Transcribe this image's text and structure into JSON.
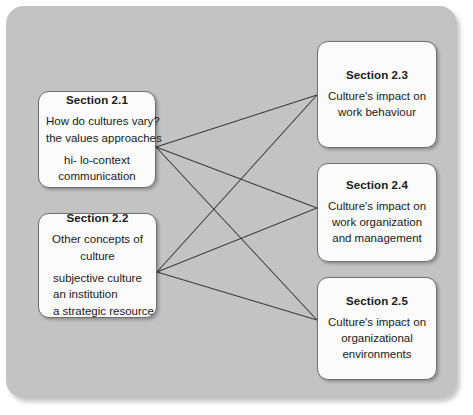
{
  "diagram": {
    "type": "bipartite-link-map",
    "colors": {
      "panel_background": "#c3c3c3",
      "node_fill": "#fbfbfb",
      "node_border": "#6e6e6e",
      "link_stroke": "#3c3c3c",
      "text": "#1a1a1a",
      "page_background": "#ffffff"
    },
    "nodes": [
      {
        "id": "s21",
        "title": "Section 2.1",
        "group_a": [
          "How do cultures vary?",
          "the values approaches"
        ],
        "group_b": [
          "hi- lo-context",
          "communication"
        ],
        "align": "center",
        "side": "left"
      },
      {
        "id": "s22",
        "title": "Section 2.2",
        "group_a": [
          "Other concepts of",
          "culture"
        ],
        "group_b": [
          "subjective culture",
          "an institution",
          "a strategic resource"
        ],
        "align": "left",
        "side": "left"
      },
      {
        "id": "s23",
        "title": "Section 2.3",
        "group_a": [
          "Culture's impact on",
          "work behaviour"
        ],
        "group_b": [],
        "align": "center",
        "side": "right"
      },
      {
        "id": "s24",
        "title": "Section 2.4",
        "group_a": [
          "Culture's impact on",
          "work organization",
          "and management"
        ],
        "group_b": [],
        "align": "center",
        "side": "right"
      },
      {
        "id": "s25",
        "title": "Section 2.5",
        "group_a": [
          "Culture's impact on",
          "organizational",
          "environments"
        ],
        "group_b": [],
        "align": "center",
        "side": "right"
      }
    ],
    "anchors": {
      "s21": {
        "x": 156,
        "y": 147
      },
      "s22": {
        "x": 157,
        "y": 272
      },
      "s23": {
        "x": 317,
        "y": 95
      },
      "s24": {
        "x": 317,
        "y": 208
      },
      "s25": {
        "x": 317,
        "y": 320
      }
    },
    "links": [
      {
        "from": "s21",
        "to": "s23"
      },
      {
        "from": "s21",
        "to": "s24"
      },
      {
        "from": "s21",
        "to": "s25"
      },
      {
        "from": "s22",
        "to": "s23"
      },
      {
        "from": "s22",
        "to": "s24"
      },
      {
        "from": "s22",
        "to": "s25"
      }
    ]
  }
}
